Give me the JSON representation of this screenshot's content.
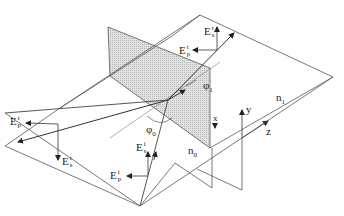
{
  "diagram": {
    "colors": {
      "line": "#555555",
      "plane_of_incidence_fill": "#d4d4d4",
      "text": "#222222",
      "background": "#ffffff"
    },
    "media": {
      "upper": "n",
      "upper_sub": "1",
      "lower": "n",
      "lower_sub": "0"
    },
    "axes": {
      "x": "x",
      "y": "y",
      "z": "z"
    },
    "angles": {
      "incidence": {
        "sym": "φ",
        "sub": "0"
      },
      "transmission": {
        "sym": "φ",
        "sub": "1"
      }
    },
    "fields": {
      "transmitted_s": {
        "base": "E",
        "sup": "t",
        "sub": "s"
      },
      "transmitted_p": {
        "base": "E",
        "sup": "t",
        "sub": "p"
      },
      "reflected_p": {
        "base": "E",
        "sup": "r",
        "sub": "p"
      },
      "reflected_s": {
        "base": "E",
        "sup": "r",
        "sub": "s"
      },
      "incident_s": {
        "base": "E",
        "sup": "i",
        "sub": "s"
      },
      "incident_p": {
        "base": "E",
        "sup": "i",
        "sub": "p"
      }
    }
  }
}
